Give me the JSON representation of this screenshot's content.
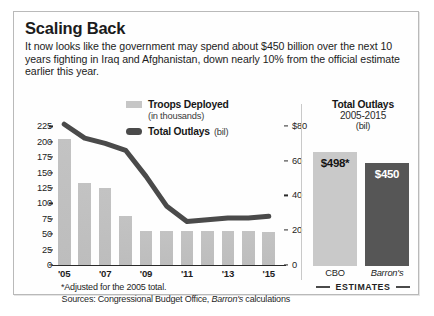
{
  "header": {
    "title": "Scaling Back",
    "deck": "It now looks like the government may spend about $450 billion over the next 10 years fighting in Iraq and Afghanistan, down nearly 10% from the official estimate earlier this year."
  },
  "legend": {
    "bars_label": "Troops Deployed",
    "bars_sub": "(in thousands)",
    "line_label": "Total Outlays",
    "line_unit": "(bil)",
    "bars_color": "#c6c6c6",
    "line_color": "#4a4a4a"
  },
  "footnote": "*Adjusted for the 2005 total.",
  "sources_prefix": "Sources: Congressional Budget Office, ",
  "sources_italic": "Barron's",
  "sources_suffix": " calculations",
  "side_panel": {
    "title": "Total Outlays",
    "subtitle": "2005-2015",
    "unit": "(bil)",
    "estimates_label": "ESTIMATES",
    "bars": [
      {
        "label": "CBO",
        "value_label": "$498*",
        "value": 498,
        "color": "#c9c9c9",
        "text_color": "#141414",
        "italic_label": false
      },
      {
        "label": "Barron's",
        "value_label": "$450",
        "value": 450,
        "color": "#565656",
        "text_color": "#ffffff",
        "italic_label": true
      }
    ]
  },
  "chart_data": {
    "type": "bar",
    "title": "Scaling Back",
    "xlabel": "",
    "ylabel": "Troops Deployed (in thousands)",
    "y2label": "Total Outlays (bil)",
    "ylim": [
      0,
      237
    ],
    "y2lim": [
      0,
      84
    ],
    "grid": false,
    "legend_position": "top-center",
    "categories": [
      "'05",
      "'06",
      "'07",
      "'08",
      "'09",
      "'10",
      "'11",
      "'12",
      "'13",
      "'14",
      "'15"
    ],
    "xtick_labels": [
      "'05",
      "",
      "'07",
      "",
      "'09",
      "",
      "'11",
      "",
      "'13",
      "",
      "'15"
    ],
    "ytick_labels": [
      "225",
      "200",
      "175",
      "150",
      "125",
      "100",
      "75",
      "50",
      "25",
      "0"
    ],
    "ytick_values": [
      225,
      200,
      175,
      150,
      125,
      100,
      75,
      50,
      25,
      0
    ],
    "y2tick_labels": [
      "$80",
      "60",
      "40",
      "20",
      "0"
    ],
    "y2tick_values": [
      80,
      60,
      40,
      20,
      0
    ],
    "series": [
      {
        "name": "Troops Deployed",
        "type": "bar",
        "axis": "left",
        "unit": "thousands",
        "color": "#c0c0c0",
        "values": [
          205,
          133,
          125,
          80,
          56,
          56,
          56,
          56,
          56,
          56,
          54
        ]
      },
      {
        "name": "Total Outlays",
        "type": "line",
        "axis": "right",
        "unit": "billions",
        "color": "#4a4a4a",
        "values": [
          81,
          73,
          70,
          66,
          51,
          34,
          25,
          26,
          27,
          27,
          28
        ]
      }
    ]
  }
}
